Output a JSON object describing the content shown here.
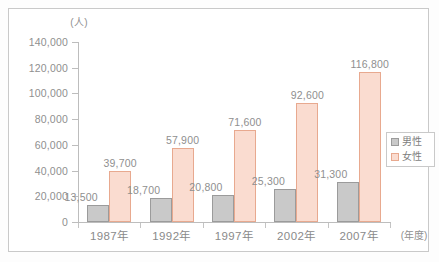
{
  "chart_data": {
    "type": "bar",
    "title": "",
    "subtitle": "",
    "xlabel": "(年度)",
    "ylabel": "(人)",
    "ylim": [
      0,
      140000
    ],
    "grid": false,
    "legend_position": "right",
    "categories": [
      "1987年",
      "1992年",
      "1997年",
      "2002年",
      "2007年"
    ],
    "ytick_labels": [
      "140,000",
      "120,000",
      "100,000",
      "80,000",
      "60,000",
      "40,000",
      "20,000",
      "0"
    ],
    "ytick_values": [
      140000,
      120000,
      100000,
      80000,
      60000,
      40000,
      20000,
      0
    ],
    "series": [
      {
        "name": "男性",
        "color": "#c9c9c9",
        "border_color": "#9b9b9b",
        "values": [
          13500,
          18700,
          20800,
          25300,
          31300
        ],
        "labels": [
          "13,500",
          "18,700",
          "20,800",
          "25,300",
          "31,300"
        ]
      },
      {
        "name": "女性",
        "color": "#fadcd0",
        "border_color": "#e8a98f",
        "values": [
          39700,
          57900,
          71600,
          92600,
          116800
        ],
        "labels": [
          "39,700",
          "57,900",
          "71,600",
          "92,600",
          "116,800"
        ]
      }
    ]
  },
  "legend": {
    "items": [
      {
        "label": "男性",
        "swatch": "male"
      },
      {
        "label": "女性",
        "swatch": "female"
      }
    ]
  }
}
